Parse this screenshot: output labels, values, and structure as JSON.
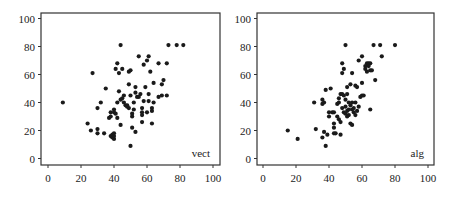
{
  "chart_data": [
    {
      "type": "scatter",
      "title": "",
      "label": "vect",
      "xlabel": "",
      "ylabel": "",
      "xlim": [
        0,
        100
      ],
      "ylim": [
        0,
        100
      ],
      "xticks": [
        0,
        20,
        40,
        60,
        80,
        100
      ],
      "yticks": [
        0,
        20,
        40,
        60,
        80,
        100
      ],
      "grid": false,
      "points": [
        [
          9,
          40
        ],
        [
          24,
          25
        ],
        [
          26,
          20
        ],
        [
          27,
          61
        ],
        [
          30,
          36
        ],
        [
          30,
          21
        ],
        [
          30,
          18
        ],
        [
          32,
          40
        ],
        [
          34,
          18
        ],
        [
          35,
          50
        ],
        [
          37,
          29
        ],
        [
          38,
          30
        ],
        [
          38,
          33
        ],
        [
          38,
          16
        ],
        [
          39,
          15
        ],
        [
          39,
          17
        ],
        [
          40,
          14
        ],
        [
          40,
          16
        ],
        [
          40,
          18
        ],
        [
          40,
          35
        ],
        [
          40,
          33
        ],
        [
          41,
          32
        ],
        [
          41,
          64
        ],
        [
          42,
          68
        ],
        [
          42,
          40
        ],
        [
          42,
          29
        ],
        [
          43,
          48
        ],
        [
          43,
          61
        ],
        [
          44,
          81
        ],
        [
          44,
          24
        ],
        [
          44,
          42
        ],
        [
          45,
          64
        ],
        [
          45,
          43
        ],
        [
          46,
          45
        ],
        [
          46,
          40
        ],
        [
          47,
          38
        ],
        [
          48,
          37
        ],
        [
          48,
          38
        ],
        [
          49,
          36
        ],
        [
          49,
          62
        ],
        [
          49,
          53
        ],
        [
          50,
          9
        ],
        [
          50,
          63
        ],
        [
          50,
          45
        ],
        [
          51,
          30
        ],
        [
          51,
          32
        ],
        [
          51,
          22
        ],
        [
          52,
          40
        ],
        [
          52,
          35
        ],
        [
          53,
          19
        ],
        [
          53,
          51
        ],
        [
          53,
          47
        ],
        [
          54,
          44
        ],
        [
          55,
          73
        ],
        [
          55,
          44
        ],
        [
          56,
          46
        ],
        [
          57,
          36
        ],
        [
          57,
          33
        ],
        [
          57,
          31
        ],
        [
          57,
          26
        ],
        [
          58,
          67
        ],
        [
          58,
          41
        ],
        [
          59,
          51
        ],
        [
          60,
          70
        ],
        [
          60,
          33
        ],
        [
          61,
          73
        ],
        [
          61,
          46
        ],
        [
          61,
          41
        ],
        [
          62,
          62
        ],
        [
          63,
          36
        ],
        [
          63,
          34
        ],
        [
          63,
          25
        ],
        [
          64,
          54
        ],
        [
          64,
          40
        ],
        [
          67,
          68
        ],
        [
          67,
          44
        ],
        [
          69,
          53
        ],
        [
          69,
          45
        ],
        [
          70,
          56
        ],
        [
          72,
          68
        ],
        [
          72,
          45
        ],
        [
          73,
          81
        ],
        [
          78,
          81
        ],
        [
          82,
          81
        ]
      ]
    },
    {
      "type": "scatter",
      "title": "",
      "label": "alg",
      "xlabel": "",
      "ylabel": "",
      "xlim": [
        0,
        100
      ],
      "ylim": [
        0,
        100
      ],
      "xticks": [
        0,
        20,
        40,
        60,
        80,
        100
      ],
      "yticks": [
        0,
        20,
        40,
        60,
        80,
        100
      ],
      "grid": false,
      "points": [
        [
          15,
          20
        ],
        [
          21,
          14
        ],
        [
          31,
          40
        ],
        [
          32,
          21
        ],
        [
          36,
          15
        ],
        [
          36,
          42
        ],
        [
          36,
          39
        ],
        [
          37,
          40
        ],
        [
          37,
          19
        ],
        [
          38,
          49
        ],
        [
          38,
          9
        ],
        [
          39,
          17
        ],
        [
          40,
          30
        ],
        [
          40,
          33
        ],
        [
          41,
          50
        ],
        [
          42,
          33
        ],
        [
          43,
          33
        ],
        [
          43,
          25
        ],
        [
          43,
          22
        ],
        [
          43,
          18
        ],
        [
          44,
          18
        ],
        [
          45,
          30
        ],
        [
          45,
          39
        ],
        [
          46,
          43
        ],
        [
          46,
          40
        ],
        [
          46,
          28
        ],
        [
          47,
          46
        ],
        [
          47,
          26
        ],
        [
          47,
          17
        ],
        [
          48,
          68
        ],
        [
          48,
          61
        ],
        [
          48,
          46
        ],
        [
          48,
          36
        ],
        [
          49,
          64
        ],
        [
          49,
          33
        ],
        [
          49,
          45
        ],
        [
          50,
          81
        ],
        [
          50,
          32
        ],
        [
          50,
          42
        ],
        [
          50,
          37
        ],
        [
          51,
          30
        ],
        [
          51,
          34
        ],
        [
          51,
          51
        ],
        [
          51,
          46
        ],
        [
          52,
          40
        ],
        [
          52,
          31
        ],
        [
          52,
          35
        ],
        [
          53,
          53
        ],
        [
          53,
          25
        ],
        [
          53,
          38
        ],
        [
          54,
          61
        ],
        [
          54,
          24
        ],
        [
          54,
          40
        ],
        [
          54,
          35
        ],
        [
          55,
          36
        ],
        [
          55,
          33
        ],
        [
          56,
          52
        ],
        [
          56,
          40
        ],
        [
          56,
          31
        ],
        [
          57,
          51
        ],
        [
          57,
          34
        ],
        [
          58,
          70
        ],
        [
          58,
          37
        ],
        [
          59,
          44
        ],
        [
          60,
          73
        ],
        [
          60,
          54
        ],
        [
          60,
          45
        ],
        [
          61,
          45
        ],
        [
          62,
          66
        ],
        [
          62,
          64
        ],
        [
          63,
          62
        ],
        [
          63,
          68
        ],
        [
          64,
          68
        ],
        [
          64,
          66
        ],
        [
          65,
          63
        ],
        [
          65,
          68
        ],
        [
          65,
          35
        ],
        [
          66,
          63
        ],
        [
          67,
          81
        ],
        [
          68,
          56
        ],
        [
          71,
          81
        ],
        [
          72,
          73
        ],
        [
          80,
          81
        ]
      ]
    }
  ],
  "panels": {
    "left": {
      "label": "vect",
      "xticks": [
        "0",
        "20",
        "40",
        "60",
        "80",
        "100"
      ],
      "yticks": [
        "0",
        "20",
        "40",
        "60",
        "80",
        "100"
      ]
    },
    "right": {
      "label": "alg",
      "xticks": [
        "0",
        "20",
        "40",
        "60",
        "80",
        "100"
      ],
      "yticks": [
        "0",
        "20",
        "40",
        "60",
        "80",
        "100"
      ]
    }
  },
  "colors": {
    "marker": "#1a1a1a",
    "axis": "#333333",
    "text": "#222222"
  }
}
